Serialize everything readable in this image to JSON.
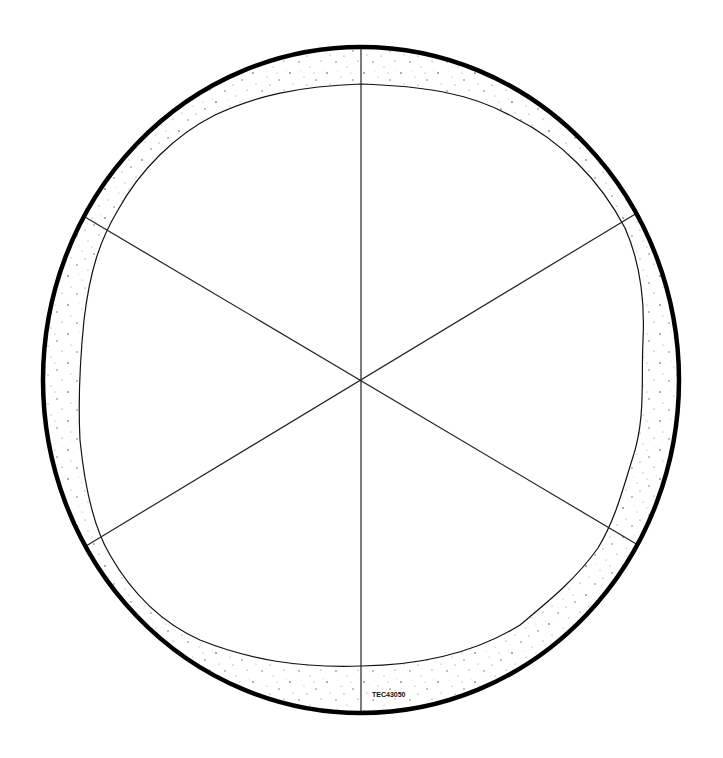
{
  "diagram": {
    "type": "pie-crust-template",
    "segments": 6,
    "label": "TEC43050",
    "colors": {
      "background": "#ffffff",
      "outline": "#000000",
      "lines": "#222222",
      "speckle": "#555555"
    },
    "geometry": {
      "center": [
        361,
        380
      ],
      "outer_rx": 318,
      "outer_ry": 333,
      "crust_width": 35
    }
  }
}
